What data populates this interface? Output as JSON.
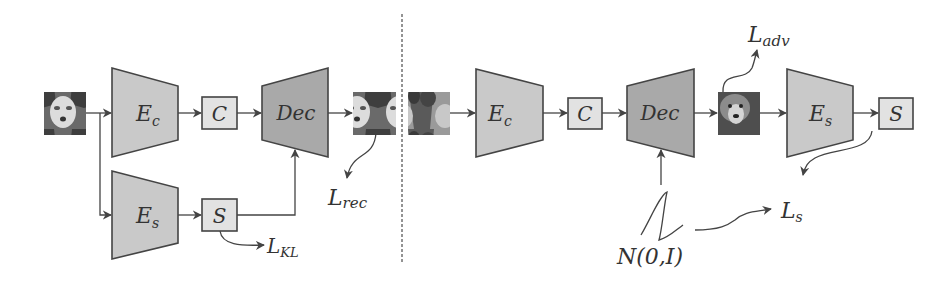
{
  "colors": {
    "encoder_fill": "#c9c9c9",
    "decoder_fill": "#a9a9a9",
    "latent_box_fill": "#e2e2e2",
    "stroke": "#444444",
    "background": "#ffffff"
  },
  "left_panel": {
    "input_image": "dog-face-image",
    "content_encoder": {
      "label": "E",
      "subscript": "c"
    },
    "style_encoder": {
      "label": "E",
      "subscript": "s"
    },
    "content_code": {
      "label": "C"
    },
    "style_code": {
      "label": "S"
    },
    "decoder": {
      "label": "Dec"
    },
    "output_image": "reconstructed-dog-face-image",
    "losses": {
      "reconstruction": {
        "label": "L",
        "subscript": "rec"
      },
      "kl": {
        "label": "L",
        "subscript": "KL"
      }
    }
  },
  "right_panel": {
    "input_image": "dog-image",
    "content_encoder": {
      "label": "E",
      "subscript": "c"
    },
    "content_code": {
      "label": "C"
    },
    "decoder": {
      "label": "Dec"
    },
    "generated_image": "generated-dog-image",
    "style_encoder": {
      "label": "E",
      "subscript": "s"
    },
    "style_code": {
      "label": "S"
    },
    "prior": {
      "label": "N(0,I)"
    },
    "losses": {
      "adversarial": {
        "label": "L",
        "subscript": "adv"
      },
      "style": {
        "label": "L",
        "subscript": "s"
      }
    }
  }
}
